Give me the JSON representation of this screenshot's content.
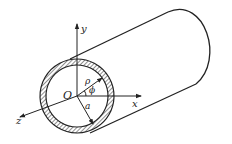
{
  "diagram": {
    "labels": {
      "origin": "O",
      "x_axis": "x",
      "y_axis": "y",
      "z_axis": "z",
      "radial": "ρ",
      "angle": "ϕ",
      "radius": "a"
    },
    "colors": {
      "stroke": "#222222",
      "background": "#ffffff"
    }
  }
}
